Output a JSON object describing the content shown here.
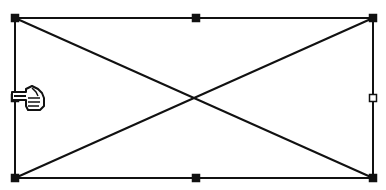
{
  "canvas": {
    "width": 386,
    "height": 190,
    "background": "#ffffff"
  },
  "shape": {
    "type": "placeholder-rectangle-with-x",
    "stroke": "#111111",
    "stroke_width": 2,
    "rect": {
      "x1": 15,
      "y1": 18,
      "x2": 373,
      "y2": 178
    }
  },
  "handles": [
    {
      "name": "top-left",
      "x": 15,
      "y": 18,
      "style": "filled"
    },
    {
      "name": "top-middle",
      "x": 196,
      "y": 18,
      "style": "filled"
    },
    {
      "name": "top-right",
      "x": 373,
      "y": 18,
      "style": "filled"
    },
    {
      "name": "middle-right",
      "x": 373,
      "y": 98,
      "style": "hollow"
    },
    {
      "name": "bottom-right",
      "x": 373,
      "y": 178,
      "style": "filled"
    },
    {
      "name": "bottom-middle",
      "x": 196,
      "y": 178,
      "style": "filled"
    },
    {
      "name": "bottom-left",
      "x": 15,
      "y": 178,
      "style": "filled"
    },
    {
      "name": "middle-left",
      "x": 15,
      "y": 98,
      "style": "filled"
    }
  ],
  "cursor": {
    "icon": "pointing-hand-icon",
    "x": 12,
    "y": 86
  }
}
